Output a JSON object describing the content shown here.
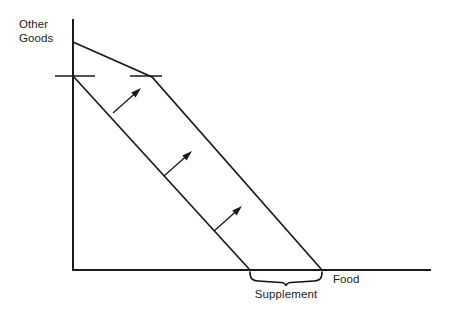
{
  "figure": {
    "background_color": "#ffffff",
    "line_color": "#1a1a1a",
    "width": 454,
    "height": 318
  },
  "axes": {
    "y_axis_label_line1": "Other",
    "y_axis_label_line2": "Goods",
    "x_axis_label": "Food",
    "origin": {
      "x": 73,
      "y": 270
    },
    "y_axis_top": {
      "x": 73,
      "y": 20
    },
    "x_axis_right": {
      "x": 430,
      "y": 270
    }
  },
  "curves": {
    "original_budget_line": {
      "name": "Original budget line",
      "points": [
        [
          73,
          76
        ],
        [
          250,
          270
        ]
      ]
    },
    "new_budget_line": {
      "name": "Budget line with food supplement",
      "points": [
        [
          73,
          42
        ],
        [
          152,
          77
        ],
        [
          322,
          270
        ]
      ]
    }
  },
  "ticks": {
    "left_tick": {
      "y": 76,
      "x_start": 55,
      "x_end": 95
    },
    "right_tick": {
      "y": 76,
      "x_start": 130,
      "x_end": 162
    }
  },
  "arrows": {
    "label": "Shift direction arrows",
    "items": [
      {
        "x1": 113,
        "y1": 113,
        "x2": 141,
        "y2": 88
      },
      {
        "x1": 164,
        "y1": 176,
        "x2": 192,
        "y2": 151
      },
      {
        "x1": 214,
        "y1": 231,
        "x2": 242,
        "y2": 206
      }
    ]
  },
  "brace": {
    "label": "Supplement",
    "x_start": 250,
    "x_end": 322,
    "y": 272
  }
}
